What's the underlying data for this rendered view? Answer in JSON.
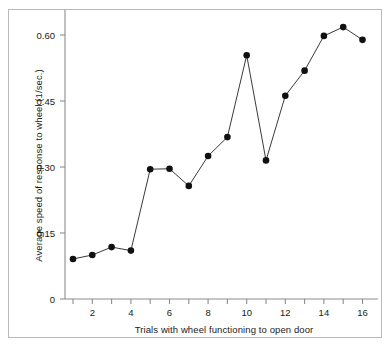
{
  "chart_data": {
    "type": "line",
    "title": "",
    "subtitle": "",
    "xlabel": "Trials with wheel functioning to open door",
    "ylabel": "Average speed of response to wheel (1/sec.)",
    "x": [
      1,
      2,
      3,
      4,
      5,
      6,
      7,
      8,
      9,
      10,
      11,
      12,
      13,
      14,
      15,
      16
    ],
    "values": [
      0.091,
      0.1,
      0.118,
      0.11,
      0.295,
      0.296,
      0.257,
      0.325,
      0.368,
      0.554,
      0.315,
      0.462,
      0.519,
      0.598,
      0.618,
      0.589
    ],
    "series": [
      {
        "name": "Average speed of response to wheel",
        "values": [
          0.091,
          0.1,
          0.118,
          0.11,
          0.295,
          0.296,
          0.257,
          0.325,
          0.368,
          0.554,
          0.315,
          0.462,
          0.519,
          0.598,
          0.618,
          0.589
        ]
      }
    ],
    "xlim": [
      0.4,
      16.8
    ],
    "ylim": [
      0,
      0.66
    ],
    "xticks": [
      1,
      2,
      3,
      4,
      5,
      6,
      7,
      8,
      9,
      10,
      11,
      12,
      13,
      14,
      15,
      16
    ],
    "xtick_labels": [
      "",
      "2",
      "",
      "4",
      "",
      "6",
      "",
      "8",
      "",
      "10",
      "",
      "12",
      "",
      "14",
      "",
      "16"
    ],
    "yticks": [
      0,
      0.15,
      0.3,
      0.45,
      0.6
    ],
    "ytick_labels": [
      "0",
      "0.15",
      "0.30",
      "0.45",
      "0.60"
    ],
    "grid": false,
    "legend": "none",
    "marker": "filled-circle",
    "marker_color": "#101010",
    "line_color": "#3a3a3a",
    "frame_color": "#b9b9b9",
    "axis_color": "#8c8c8c",
    "background": "#ffffff"
  },
  "axis": {
    "x_title": "Trials with wheel functioning to open door",
    "y_title": "Average speed of response to wheel (1/sec.)"
  },
  "ticks": {
    "y": [
      {
        "label": "0.60",
        "value": 0.6
      },
      {
        "label": "0.45",
        "value": 0.45
      },
      {
        "label": "0.30",
        "value": 0.3
      },
      {
        "label": "0.15",
        "value": 0.15
      },
      {
        "label": "0",
        "value": 0
      }
    ],
    "x": [
      {
        "label": "2",
        "value": 2
      },
      {
        "label": "4",
        "value": 4
      },
      {
        "label": "6",
        "value": 6
      },
      {
        "label": "8",
        "value": 8
      },
      {
        "label": "10",
        "value": 10
      },
      {
        "label": "12",
        "value": 12
      },
      {
        "label": "14",
        "value": 14
      },
      {
        "label": "16",
        "value": 16
      }
    ]
  }
}
